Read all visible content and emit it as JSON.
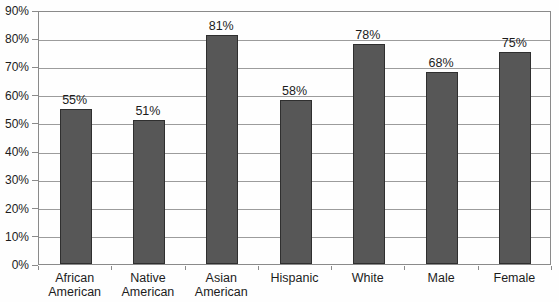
{
  "chart_data": {
    "type": "bar",
    "categories": [
      "African American",
      "Native American",
      "Asian American",
      "Hispanic",
      "White",
      "Male",
      "Female"
    ],
    "values": [
      55,
      51,
      81,
      58,
      78,
      68,
      75
    ],
    "value_labels": [
      "55%",
      "51%",
      "81%",
      "58%",
      "78%",
      "68%",
      "75%"
    ],
    "ytick_labels": [
      "0%",
      "10%",
      "20%",
      "30%",
      "40%",
      "50%",
      "60%",
      "70%",
      "80%",
      "90%"
    ],
    "title": "",
    "xlabel": "",
    "ylabel": "",
    "ylim": [
      0,
      90
    ],
    "ytick_step": 10,
    "grid": true,
    "legend_position": "none",
    "colors": {
      "bar_fill": "#575757",
      "bar_border": "#2f2f2f",
      "gridline": "#9c9c9c",
      "frame": "#8a8a8a",
      "text": "#1c1c1c",
      "background": "#fefefe"
    }
  }
}
